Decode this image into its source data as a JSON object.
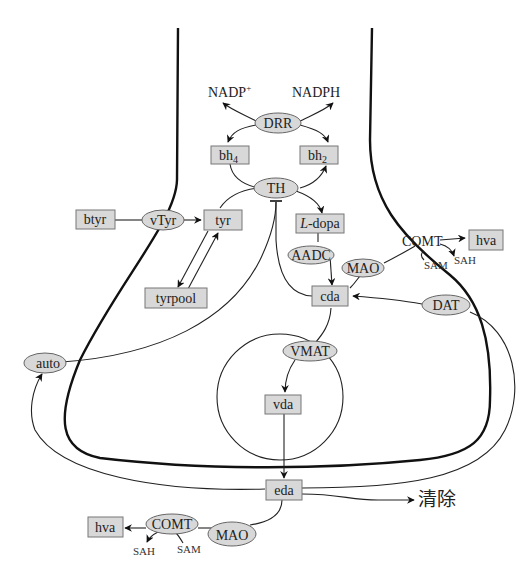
{
  "diagram": {
    "type": "dopamine-metabolism-pathway",
    "cofactors": {
      "nadp_plus": "NADP",
      "nadp_plus_sup": "+",
      "nadph": "NADPH"
    },
    "nodes": {
      "drr": "DRR",
      "bh4": "bh",
      "bh4_sub": "4",
      "bh2": "bh",
      "bh2_sub": "2",
      "th": "TH",
      "btyr": "btyr",
      "vtyr": "vTyr",
      "tyr": "tyr",
      "tyrpool": "tyrpool",
      "ldopa_italic": "L",
      "ldopa_rest": "-dopa",
      "aadc": "AADC",
      "mao_inner": "MAO",
      "comt_inner": "COMT",
      "hva_inner": "hva",
      "sam_inner": "SAM",
      "sah_inner": "SAH",
      "cda": "cda",
      "dat": "DAT",
      "auto": "auto",
      "vmat": "VMAT",
      "vda": "vda",
      "eda": "eda",
      "clearance": "清除",
      "hva_outer": "hva",
      "comt_outer": "COMT",
      "mao_outer": "MAO",
      "sah_outer": "SAH",
      "sam_outer": "SAM"
    },
    "colors": {
      "node_fill": "#d8d8d8",
      "node_stroke": "#777777",
      "line": "#222222",
      "background": "#ffffff"
    }
  }
}
